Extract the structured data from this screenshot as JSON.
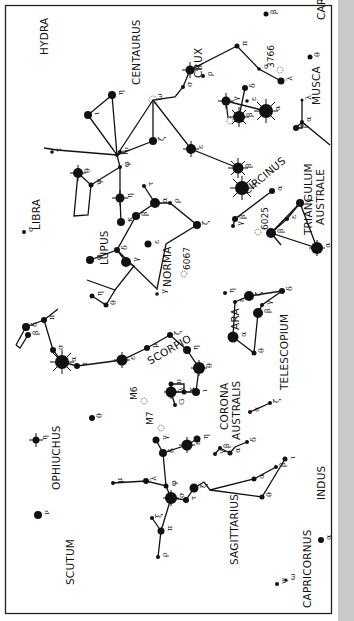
{
  "chart_title": "Southern constellations: Scorpius, Centaurus, Crux and neighbours (chart rotated 90°)",
  "constellations": [
    {
      "name": "HYDRA",
      "x": 48,
      "y": 55,
      "rot": -90
    },
    {
      "name": "CENTAURUS",
      "x": 140,
      "y": 85,
      "rot": -90
    },
    {
      "name": "CRUX",
      "x": 202,
      "y": 78,
      "rot": -90
    },
    {
      "name": "CARINA",
      "x": 325,
      "y": 20,
      "rot": -90
    },
    {
      "name": "MUSCA",
      "x": 320,
      "y": 105,
      "rot": -90
    },
    {
      "name": "LIBRA",
      "x": 40,
      "y": 230,
      "rot": -90
    },
    {
      "name": "LUPUS",
      "x": 108,
      "y": 265,
      "rot": -90
    },
    {
      "name": "CIRCINUS",
      "x": 247,
      "y": 195,
      "rot": -40
    },
    {
      "name": "TRIANGULUM",
      "x": 312,
      "y": 235,
      "rot": -90
    },
    {
      "name": "AUSTRALE",
      "x": 324,
      "y": 225,
      "rot": -90
    },
    {
      "name": "NORMA",
      "x": 171,
      "y": 287,
      "rot": -90
    },
    {
      "name": "ARA",
      "x": 239,
      "y": 330,
      "rot": -90
    },
    {
      "name": "TELESCOPIUM",
      "x": 288,
      "y": 390,
      "rot": -90
    },
    {
      "name": "SCORPIO",
      "x": 150,
      "y": 365,
      "rot": -30
    },
    {
      "name": "OPHIUCHUS",
      "x": 60,
      "y": 490,
      "rot": -90
    },
    {
      "name": "CORONA",
      "x": 228,
      "y": 430,
      "rot": -90
    },
    {
      "name": "AUSTRALIS",
      "x": 240,
      "y": 440,
      "rot": -90
    },
    {
      "name": "SAGITTARIUS",
      "x": 238,
      "y": 565,
      "rot": -90
    },
    {
      "name": "SCUTUM",
      "x": 74,
      "y": 585,
      "rot": -90
    },
    {
      "name": "CAPRICORNUS",
      "x": 311,
      "y": 608,
      "rot": -90
    },
    {
      "name": "INDUS",
      "x": 325,
      "y": 500,
      "rot": -90
    }
  ],
  "clusters": [
    {
      "label": "3766",
      "x": 274,
      "y": 68,
      "rot": -90
    },
    {
      "label": "6025",
      "x": 268,
      "y": 230,
      "rot": -90
    },
    {
      "label": "6067",
      "x": 190,
      "y": 270,
      "rot": -90
    },
    {
      "label": "M6",
      "x": 137,
      "y": 400,
      "rot": -90
    },
    {
      "label": "M7",
      "x": 153,
      "y": 425,
      "rot": -90
    }
  ],
  "stars": [
    {
      "greek": "β",
      "x": 266,
      "y": 14,
      "r": 2.5
    },
    {
      "greek": "τ",
      "x": 52,
      "y": 152,
      "r": 1.8
    },
    {
      "greek": "η",
      "x": 112,
      "y": 95,
      "r": 4
    },
    {
      "greek": "ι",
      "x": 88,
      "y": 115,
      "r": 4
    },
    {
      "greek": "θ",
      "x": 310,
      "y": 57,
      "r": 2.5
    },
    {
      "greek": "π",
      "x": 237,
      "y": 46,
      "r": 2.5
    },
    {
      "greek": "δ",
      "x": 190,
      "y": 70,
      "r": 4.5
    },
    {
      "greek": "σ",
      "x": 183,
      "y": 87,
      "r": 2
    },
    {
      "greek": "ρ",
      "x": 203,
      "y": 76,
      "r": 2
    },
    {
      "greek": "λ",
      "x": 281,
      "y": 81,
      "r": 3.5
    },
    {
      "greek": "ο",
      "x": 259,
      "y": 69,
      "r": 1.8
    },
    {
      "greek": "γ",
      "x": 226,
      "y": 101,
      "r": 4.5
    },
    {
      "greek": "δ",
      "x": 245,
      "y": 88,
      "r": 3
    },
    {
      "greek": "β",
      "x": 239,
      "y": 117,
      "r": 6
    },
    {
      "greek": "α",
      "x": 266,
      "y": 111,
      "r": 7
    },
    {
      "greek": "ε",
      "x": 247,
      "y": 101,
      "r": 1.8
    },
    {
      "greek": "λ",
      "x": 302,
      "y": 100,
      "r": 1.5
    },
    {
      "greek": "α",
      "x": 302,
      "y": 122,
      "r": 2
    },
    {
      "greek": "β",
      "x": 296,
      "y": 128,
      "r": 3
    },
    {
      "greek": "ζ",
      "x": 153,
      "y": 141,
      "r": 4
    },
    {
      "greek": "ω",
      "x": 153,
      "y": 100,
      "r": 0
    },
    {
      "greek": "ε",
      "x": 191,
      "y": 149,
      "r": 5
    },
    {
      "greek": "β",
      "x": 238,
      "y": 168,
      "r": 5.5
    },
    {
      "greek": "α",
      "x": 242,
      "y": 188,
      "r": 7
    },
    {
      "greek": "θ",
      "x": 78,
      "y": 173,
      "r": 5
    },
    {
      "greek": "μ",
      "x": 117,
      "y": 155,
      "r": 2
    },
    {
      "greek": "ν",
      "x": 120,
      "y": 152,
      "r": 2
    },
    {
      "greek": "φ",
      "x": 120,
      "y": 167,
      "r": 2
    },
    {
      "greek": "ψ",
      "x": 91,
      "y": 185,
      "r": 2.5
    },
    {
      "greek": "κ",
      "x": 121,
      "y": 222,
      "r": 4
    },
    {
      "greek": "η",
      "x": 120,
      "y": 198,
      "r": 4.5
    },
    {
      "greek": "α",
      "x": 155,
      "y": 203,
      "r": 5
    },
    {
      "greek": "ρ",
      "x": 170,
      "y": 203,
      "r": 2
    },
    {
      "greek": "τ",
      "x": 144,
      "y": 186,
      "r": 2
    },
    {
      "greek": "β",
      "x": 136,
      "y": 216,
      "r": 4
    },
    {
      "greek": "δ",
      "x": 117,
      "y": 250,
      "r": 3
    },
    {
      "greek": "γ",
      "x": 126,
      "y": 262,
      "r": 5
    },
    {
      "greek": "ε",
      "x": 148,
      "y": 244,
      "r": 3.5
    },
    {
      "greek": "φ",
      "x": 90,
      "y": 260,
      "r": 4
    },
    {
      "greek": "ζ",
      "x": 197,
      "y": 225,
      "r": 4
    },
    {
      "greek": "σ",
      "x": 24,
      "y": 232,
      "r": 2
    },
    {
      "greek": "γ",
      "x": 233,
      "y": 226,
      "r": 2
    },
    {
      "greek": "β",
      "x": 235,
      "y": 219,
      "r": 3
    },
    {
      "greek": "α",
      "x": 272,
      "y": 191,
      "r": 3
    },
    {
      "greek": "γ",
      "x": 300,
      "y": 203,
      "r": 4
    },
    {
      "greek": "ε",
      "x": 287,
      "y": 219,
      "r": 2
    },
    {
      "greek": "β",
      "x": 271,
      "y": 233,
      "r": 5
    },
    {
      "greek": "α",
      "x": 317,
      "y": 248,
      "r": 6
    },
    {
      "greek": "η",
      "x": 92,
      "y": 296,
      "r": 2.5
    },
    {
      "greek": "θ",
      "x": 106,
      "y": 305,
      "r": 2.5
    },
    {
      "greek": "γ",
      "x": 157,
      "y": 294,
      "r": 1.8
    },
    {
      "greek": "ε",
      "x": 235,
      "y": 302,
      "r": 2
    },
    {
      "greek": "ζ",
      "x": 249,
      "y": 296,
      "r": 5
    },
    {
      "greek": "α",
      "x": 233,
      "y": 337,
      "r": 5.5
    },
    {
      "greek": "β",
      "x": 258,
      "y": 313,
      "r": 5
    },
    {
      "greek": "γ",
      "x": 262,
      "y": 305,
      "r": 2
    },
    {
      "greek": "δ",
      "x": 282,
      "y": 291,
      "r": 3
    },
    {
      "greek": "θ",
      "x": 254,
      "y": 353,
      "r": 2.5
    },
    {
      "greek": "η",
      "x": 225,
      "y": 293,
      "r": 2
    },
    {
      "greek": "β",
      "x": 28,
      "y": 335,
      "r": 3
    },
    {
      "greek": "δ",
      "x": 26,
      "y": 327,
      "r": 4
    },
    {
      "greek": "π",
      "x": 44,
      "y": 320,
      "r": 3
    },
    {
      "greek": "σ",
      "x": 53,
      "y": 350,
      "r": 3
    },
    {
      "greek": "α",
      "x": 62,
      "y": 362,
      "r": 7
    },
    {
      "greek": "τ",
      "x": 77,
      "y": 366,
      "r": 3
    },
    {
      "greek": "ε",
      "x": 122,
      "y": 360,
      "r": 5.5
    },
    {
      "greek": "μ",
      "x": 147,
      "y": 348,
      "r": 3
    },
    {
      "greek": "ζ",
      "x": 170,
      "y": 335,
      "r": 3
    },
    {
      "greek": "η",
      "x": 187,
      "y": 350,
      "r": 4
    },
    {
      "greek": "θ",
      "x": 199,
      "y": 368,
      "r": 6
    },
    {
      "greek": "ι",
      "x": 196,
      "y": 392,
      "r": 4
    },
    {
      "greek": "κ",
      "x": 184,
      "y": 392,
      "r": 2.5
    },
    {
      "greek": "λ",
      "x": 171,
      "y": 392,
      "r": 5.5
    },
    {
      "greek": "υ",
      "x": 171,
      "y": 384,
      "r": 2.5
    },
    {
      "greek": "G",
      "x": 175,
      "y": 405,
      "r": 2
    },
    {
      "greek": "η",
      "x": 36,
      "y": 440,
      "r": 3.5
    },
    {
      "greek": "θ",
      "x": 92,
      "y": 418,
      "r": 3
    },
    {
      "greek": "ν",
      "x": 38,
      "y": 515,
      "r": 4
    },
    {
      "greek": "γ",
      "x": 156,
      "y": 440,
      "r": 3.5
    },
    {
      "greek": "δ",
      "x": 163,
      "y": 453,
      "r": 4
    },
    {
      "greek": "ε",
      "x": 187,
      "y": 445,
      "r": 5.5
    },
    {
      "greek": "η",
      "x": 197,
      "y": 439,
      "r": 3.5
    },
    {
      "greek": "λ",
      "x": 146,
      "y": 481,
      "r": 3
    },
    {
      "greek": "μ",
      "x": 113,
      "y": 483,
      "r": 2
    },
    {
      "greek": "φ",
      "x": 166,
      "y": 486,
      "r": 2.5
    },
    {
      "greek": "σ",
      "x": 171,
      "y": 498,
      "r": 6
    },
    {
      "greek": "τ",
      "x": 186,
      "y": 500,
      "r": 3
    },
    {
      "greek": "ζ",
      "x": 194,
      "y": 488,
      "r": 4.5
    },
    {
      "greek": "ξ",
      "x": 152,
      "y": 518,
      "r": 2
    },
    {
      "greek": "π",
      "x": 161,
      "y": 531,
      "r": 3.5
    },
    {
      "greek": "ρ",
      "x": 158,
      "y": 557,
      "r": 2
    },
    {
      "greek": "α",
      "x": 230,
      "y": 453,
      "r": 2.5
    },
    {
      "greek": "β",
      "x": 220,
      "y": 448,
      "r": 2
    },
    {
      "greek": "γ",
      "x": 215,
      "y": 454,
      "r": 2
    },
    {
      "greek": "δ",
      "x": 247,
      "y": 442,
      "r": 2
    },
    {
      "greek": "α",
      "x": 254,
      "y": 479,
      "r": 2.5
    },
    {
      "greek": "β",
      "x": 276,
      "y": 467,
      "r": 2
    },
    {
      "greek": "θ",
      "x": 262,
      "y": 497,
      "r": 2.5
    },
    {
      "greek": "ι",
      "x": 285,
      "y": 459,
      "r": 2.5
    },
    {
      "greek": "α",
      "x": 250,
      "y": 412,
      "r": 2
    },
    {
      "greek": "ζ",
      "x": 270,
      "y": 403,
      "r": 2
    },
    {
      "greek": "ψ",
      "x": 277,
      "y": 584,
      "r": 2
    },
    {
      "greek": "ω",
      "x": 286,
      "y": 580,
      "r": 1.5
    },
    {
      "greek": "α",
      "x": 321,
      "y": 540,
      "r": 3
    }
  ]
}
